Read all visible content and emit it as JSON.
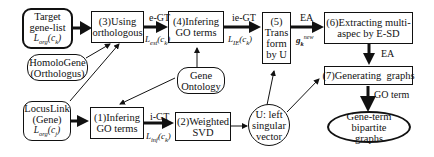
{
  "nodes": {
    "target_gene_list": {
      "line1": "Target",
      "line2": "gene-list",
      "math": "L",
      "math_sub": "org",
      "math_arg": "(c",
      "math_arg_sub": "k",
      "math_close": ")"
    },
    "homologene": {
      "line1": "HomoloGene",
      "line2": "(Orthologus)"
    },
    "locuslink": {
      "line1": "LocusLink",
      "line2": "(Gene)",
      "math": "L",
      "math_sub": "org",
      "math_arg": "(c",
      "math_arg_sub": "j",
      "math_close": ")"
    },
    "step3": {
      "line1": "(3)Using",
      "line2": "orthologous"
    },
    "step4": {
      "line1": "(4)Infering",
      "line2": "GO terms"
    },
    "step5": {
      "line1": "(5)",
      "line2": "Trans",
      "line3": "form",
      "line4": "by U"
    },
    "step6": {
      "line1": "(6)Extracting multi-",
      "line2": "aspec by E-SD"
    },
    "step7": {
      "line1": "(7)Generating  graphs"
    },
    "step1": {
      "line1": "(1)Infering",
      "line2": "GO terms"
    },
    "step2": {
      "line1": "(2)Weighted",
      "line2": "SVD"
    },
    "gene_ontology": {
      "line1": "Gene",
      "line2": "Ontology"
    },
    "u_vector": {
      "line1": "U: left",
      "line2": "singular",
      "line3": "vector"
    },
    "bipartite": {
      "line1": "Gene-term bipartite",
      "line2": "graphs"
    }
  },
  "edges": {
    "e_gt": {
      "label": "e-GT",
      "math": "L",
      "math_sub": "est",
      "math_arg": "(c",
      "math_arg_sub": "k",
      "math_close": ")"
    },
    "ie_gt": {
      "label": "ie-GT",
      "math": "L",
      "math_sub": "IE",
      "math_arg": "(c",
      "math_arg_sub": "k",
      "math_close": ")"
    },
    "ea_top": {
      "label": "EA",
      "math": "g",
      "math_sub": "k",
      "math_sup": "new"
    },
    "ea_down": {
      "label": "EA"
    },
    "i_gt": {
      "label": "i-GT",
      "math": "L",
      "math_sub": "inf",
      "math_arg": "(c",
      "math_arg_sub": "k",
      "math_close": ")"
    },
    "go_term": {
      "label": "GO term"
    }
  },
  "colors": {
    "stroke": "#111111",
    "background": "#ffffff"
  }
}
